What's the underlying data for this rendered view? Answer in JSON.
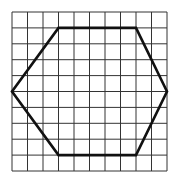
{
  "diagram": {
    "type": "hexagon-on-grid",
    "grid": {
      "columns": 10,
      "rows": 10,
      "origin_px": [
        12,
        12
      ],
      "cell_w_px": 15.5,
      "cell_h_px": 15.9,
      "line_color": "#333333"
    },
    "shape": {
      "name": "hexagon",
      "vertices_grid": [
        [
          3,
          1
        ],
        [
          8,
          1
        ],
        [
          10,
          5
        ],
        [
          8,
          9
        ],
        [
          3,
          9
        ],
        [
          0,
          5
        ]
      ],
      "stroke_color": "#111111",
      "stroke_width": 2.6
    }
  }
}
